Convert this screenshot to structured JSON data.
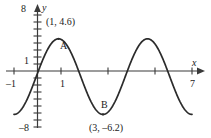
{
  "figure": {
    "name": "sinusoidal-graph",
    "background_color": "#ffffff",
    "curve_color": "#2b2b2b",
    "axis_color": "#3a3a3a"
  },
  "axes": {
    "y_axis_name": "y",
    "x_axis_name": "x",
    "y_top_label": "8",
    "y_one_label": "1",
    "y_bottom_label": "–8",
    "x_left_label": "–1",
    "x_one_label": "1",
    "x_right_label": "7"
  },
  "annotations": {
    "max_point_letter": "A",
    "max_point_coords": "(1, 4.6)",
    "min_point_letter": "B",
    "min_point_coords": "(3, –6.2)"
  },
  "chart_data": {
    "type": "line",
    "title": "",
    "xlabel": "x",
    "ylabel": "y",
    "xlim": [
      -1,
      7
    ],
    "ylim": [
      -8,
      8
    ],
    "grid": false,
    "legend": null,
    "x_ticks": [
      -1,
      1,
      3,
      5,
      7
    ],
    "x_tick_labels": [
      "–1",
      "1",
      "",
      "",
      "7"
    ],
    "y_ticks": [
      -8,
      -7,
      -6,
      -5,
      -4,
      -3,
      -2,
      -1,
      0,
      1,
      2,
      3,
      4,
      5,
      6,
      7,
      8
    ],
    "y_tick_labels": [
      "–8",
      "",
      "",
      "",
      "",
      "",
      "",
      "",
      "",
      "1",
      "",
      "",
      "",
      "",
      "",
      "",
      "8"
    ],
    "series": [
      {
        "name": "curve",
        "description": "sinusoid with period 4, maximum (1, 4.6), minimum (3, -6.2), midline -0.8, amplitude 5.4",
        "period": 4,
        "amplitude": 5.4,
        "midline": -0.8,
        "max_point": [
          1,
          4.6
        ],
        "min_point": [
          3,
          -6.2
        ],
        "x": [
          -1,
          -0.75,
          -0.5,
          -0.25,
          0,
          0.25,
          0.5,
          0.75,
          1,
          1.25,
          1.5,
          1.75,
          2,
          2.25,
          2.5,
          2.75,
          3,
          3.25,
          3.5,
          3.75,
          4,
          4.25,
          4.5,
          4.75,
          5,
          5.25,
          5.5,
          5.75,
          6,
          6.25,
          6.5,
          6.75,
          7
        ],
        "y": [
          -6.2,
          -5.87,
          -4.62,
          -2.87,
          -0.8,
          1.27,
          3.02,
          4.27,
          4.6,
          4.27,
          3.02,
          1.27,
          -0.8,
          -2.87,
          -4.62,
          -5.87,
          -6.2,
          -5.87,
          -4.62,
          -2.87,
          -0.8,
          1.27,
          3.02,
          4.27,
          4.6,
          4.27,
          3.02,
          1.27,
          -0.8,
          -2.87,
          -4.62,
          -5.87,
          -6.2
        ]
      }
    ],
    "annotations": [
      {
        "label": "A",
        "point": [
          1,
          4.6
        ],
        "coords_text": "(1, 4.6)"
      },
      {
        "label": "B",
        "point": [
          3,
          -6.2
        ],
        "coords_text": "(3, –6.2)"
      }
    ]
  }
}
